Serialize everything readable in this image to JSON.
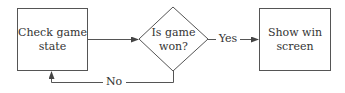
{
  "diagram": {
    "type": "flowchart",
    "nodes": [
      {
        "id": "check",
        "shape": "rectangle",
        "line1": "Check game",
        "line2": "state"
      },
      {
        "id": "decision",
        "shape": "diamond",
        "line1": "Is game",
        "line2": "won?"
      },
      {
        "id": "win",
        "shape": "rectangle",
        "line1": "Show win",
        "line2": "screen"
      }
    ],
    "edges": [
      {
        "from": "check",
        "to": "decision",
        "label": ""
      },
      {
        "from": "decision",
        "to": "win",
        "label": "Yes"
      },
      {
        "from": "decision",
        "to": "check",
        "label": "No"
      }
    ],
    "colors": {
      "stroke": "#555555",
      "text": "#333333",
      "background": "#ffffff"
    }
  }
}
